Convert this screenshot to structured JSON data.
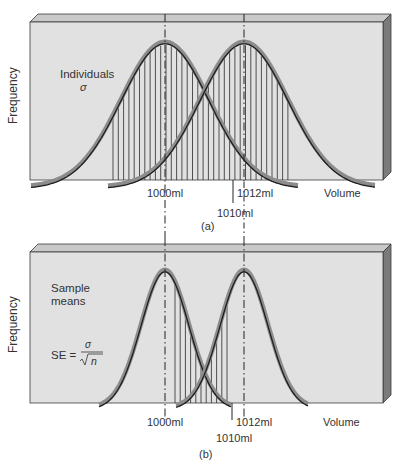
{
  "chart_data": [
    {
      "type": "line",
      "panel_label": "(a)",
      "title": "Distribution of individual volumes",
      "ylabel": "Frequency",
      "xlabel": "Volume",
      "annotation": [
        "Individuals",
        "σ"
      ],
      "tick_labels": [
        "1000ml",
        "1010ml",
        "1012ml"
      ],
      "series": [
        {
          "name": "Population mean 1000 ml",
          "mean": 1000,
          "sd": "wide"
        },
        {
          "name": "Population mean 1012 ml",
          "mean": 1012,
          "sd": "wide"
        }
      ],
      "shaded_region": "area under both curves (overlap)",
      "reference_lines": [
        1000,
        1012
      ],
      "marked_value": 1010,
      "grid": false,
      "legend": "none"
    },
    {
      "type": "line",
      "panel_label": "(b)",
      "title": "Distribution of sample means",
      "ylabel": "Frequency",
      "xlabel": "Volume",
      "annotation": [
        "Sample",
        "means",
        "SE = σ / √n"
      ],
      "tick_labels": [
        "1000ml",
        "1010ml",
        "1012ml"
      ],
      "series": [
        {
          "name": "Sample means around 1000 ml",
          "mean": 1000,
          "sd": "narrow (SE)"
        },
        {
          "name": "Sample means around 1012 ml",
          "mean": 1012,
          "sd": "narrow (SE)"
        }
      ],
      "shaded_region": "overlap area between the two means",
      "reference_lines": [
        1000,
        1012
      ],
      "marked_value": 1010,
      "grid": false,
      "legend": "none"
    }
  ],
  "panel_a": {
    "ylabel": "Frequency",
    "xlabel": "Volume",
    "annot_line1": "Individuals",
    "annot_line2": "σ",
    "tick_1000": "1000ml",
    "tick_1012": "1012ml",
    "tick_1010": "1010ml",
    "caption": "(a)"
  },
  "panel_b": {
    "ylabel": "Frequency",
    "xlabel": "Volume",
    "annot_line1": "Sample",
    "annot_line2": "means",
    "se_label": "SE =",
    "se_num": "σ",
    "se_den": "n",
    "tick_1000": "1000ml",
    "tick_1012": "1012ml",
    "tick_1010": "1010ml",
    "caption": "(b)"
  },
  "colors": {
    "face": "#e1e1e1",
    "top": "#c9c9c9",
    "side": "#7b7b7b",
    "edge": "#3a3a3a",
    "curve_shadow": "#8c8c8c",
    "curve_line": "#1e1e1e",
    "hatch": "#2a2a2a"
  }
}
